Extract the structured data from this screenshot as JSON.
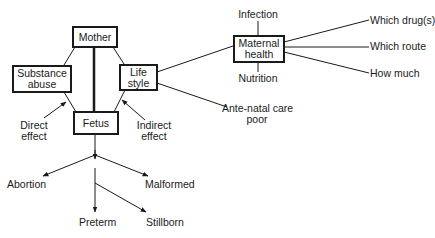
{
  "diagram": {
    "nodes": {
      "mother": "Mother",
      "substance_abuse": [
        "Substance",
        "abuse"
      ],
      "life_style": [
        "Life",
        "style"
      ],
      "fetus": "Fetus",
      "maternal_health": [
        "Maternal",
        "health"
      ]
    },
    "annotations": {
      "direct_effect": [
        "Direct",
        "effect"
      ],
      "indirect_effect": [
        "Indirect",
        "effect"
      ],
      "infection": "Infection",
      "nutrition": "Nutrition",
      "antenatal_care": [
        "Ante-natal care",
        "poor"
      ],
      "which_drugs": "Which drug(s)",
      "which_route": "Which route",
      "how_much": "How much"
    },
    "outcomes": {
      "abortion": "Abortion",
      "malformed": "Malformed",
      "preterm": "Preterm",
      "stillborn": "Stillborn"
    },
    "colors": {
      "line": "#1a1a1a",
      "background": "#ffffff"
    }
  }
}
